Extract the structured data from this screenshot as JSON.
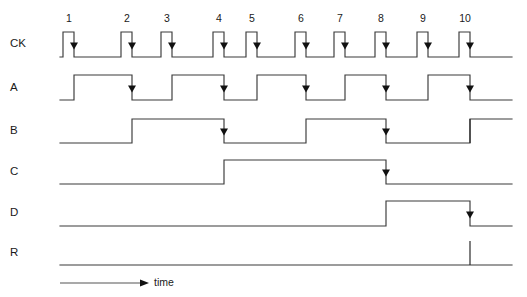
{
  "figure": {
    "type": "digital-timing-diagram",
    "title": "",
    "time_axis_label": "time",
    "background_color": "#ffffff",
    "line_color": "#3a3a3a",
    "marker_color": "#111111"
  },
  "clock": {
    "label": "CK",
    "pulse_count": 10,
    "pulse_numbers": [
      "1",
      "2",
      "3",
      "4",
      "5",
      "6",
      "7",
      "8",
      "9",
      "10"
    ],
    "pulse_rise_x": [
      63,
      121,
      161,
      213,
      246,
      295,
      334,
      375,
      417,
      459
    ],
    "pulse_width_px": 11,
    "active_edge": "falling"
  },
  "signals": [
    {
      "name": "A",
      "label": "A",
      "description": "toggles on every clock falling edge",
      "initial_level": "low",
      "toggle_on_pulses": [
        1,
        2,
        3,
        4,
        5,
        6,
        7,
        8,
        9,
        10
      ],
      "marker_pulses": [
        2,
        4,
        6,
        8,
        10
      ]
    },
    {
      "name": "B",
      "label": "B",
      "description": "toggles on every falling edge of A",
      "initial_level": "low",
      "toggle_on_pulses": [
        2,
        4,
        6,
        8,
        10
      ],
      "marker_pulses": [
        4,
        8
      ]
    },
    {
      "name": "C",
      "label": "C",
      "description": "toggles on every falling edge of B",
      "initial_level": "low",
      "toggle_on_pulses": [
        4,
        8
      ],
      "marker_pulses": [
        8
      ]
    },
    {
      "name": "D",
      "label": "D",
      "description": "toggles on every falling edge of C",
      "initial_level": "low",
      "toggle_on_pulses": [
        8,
        10
      ],
      "marker_pulses": [
        10
      ]
    },
    {
      "name": "R",
      "label": "R",
      "description": "reset pulse at count 10",
      "initial_level": "low",
      "toggle_on_pulses": [],
      "marker_pulses": []
    }
  ],
  "chart_data": {
    "type": "line",
    "title": "",
    "xlabel": "time",
    "ylabel": "",
    "grid": false,
    "legend_position": "left-labels",
    "categories": [
      "1",
      "2",
      "3",
      "4",
      "5",
      "6",
      "7",
      "8",
      "9",
      "10"
    ],
    "series": [
      {
        "name": "CK",
        "values": [
          1,
          1,
          1,
          1,
          1,
          1,
          1,
          1,
          1,
          1
        ]
      },
      {
        "name": "A",
        "values": [
          1,
          0,
          1,
          0,
          1,
          0,
          1,
          0,
          1,
          0
        ]
      },
      {
        "name": "B",
        "values": [
          0,
          1,
          1,
          0,
          0,
          1,
          1,
          0,
          0,
          1
        ]
      },
      {
        "name": "C",
        "values": [
          0,
          0,
          0,
          1,
          1,
          1,
          1,
          0,
          0,
          0
        ]
      },
      {
        "name": "D",
        "values": [
          0,
          0,
          0,
          0,
          0,
          0,
          0,
          1,
          1,
          0
        ]
      },
      {
        "name": "R",
        "values": [
          0,
          0,
          0,
          0,
          0,
          0,
          0,
          0,
          0,
          1
        ]
      }
    ]
  }
}
